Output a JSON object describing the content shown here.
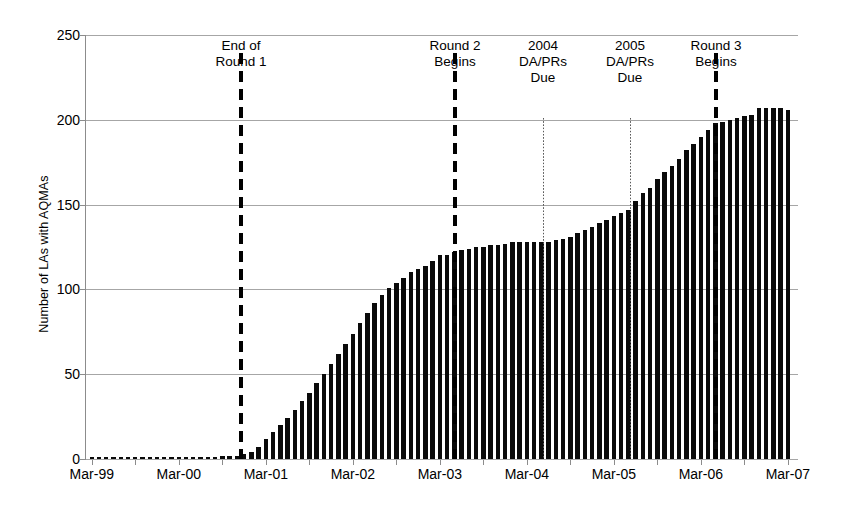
{
  "chart_data": {
    "type": "bar",
    "title": "",
    "xlabel": "",
    "ylabel": "Number of LAs with AQMAs",
    "ylim": [
      0,
      250
    ],
    "yticks": [
      0,
      50,
      100,
      150,
      200,
      250
    ],
    "ytick_labels": [
      "0",
      "50",
      "100",
      "150",
      "200",
      "250"
    ],
    "xtick_labels": [
      "Mar-99",
      "Mar-00",
      "Mar-01",
      "Mar-02",
      "Mar-03",
      "Mar-04",
      "Mar-05",
      "Mar-06",
      "Mar-07"
    ],
    "grid": "horizontal",
    "legend": "none",
    "bar_color": "#0a0a0a",
    "gridline_color": "#a6a6a6",
    "x_start": "Mar-99",
    "x_interval": "monthly",
    "categories": [
      "Mar-99",
      "Apr-99",
      "May-99",
      "Jun-99",
      "Jul-99",
      "Aug-99",
      "Sep-99",
      "Oct-99",
      "Nov-99",
      "Dec-99",
      "Jan-00",
      "Feb-00",
      "Mar-00",
      "Apr-00",
      "May-00",
      "Jun-00",
      "Jul-00",
      "Aug-00",
      "Sep-00",
      "Oct-00",
      "Nov-00",
      "Dec-00",
      "Jan-01",
      "Feb-01",
      "Mar-01",
      "Apr-01",
      "May-01",
      "Jun-01",
      "Jul-01",
      "Aug-01",
      "Sep-01",
      "Oct-01",
      "Nov-01",
      "Dec-01",
      "Jan-02",
      "Feb-02",
      "Mar-02",
      "Apr-02",
      "May-02",
      "Jun-02",
      "Jul-02",
      "Aug-02",
      "Sep-02",
      "Oct-02",
      "Nov-02",
      "Dec-02",
      "Jan-03",
      "Feb-03",
      "Mar-03",
      "Apr-03",
      "May-03",
      "Jun-03",
      "Jul-03",
      "Aug-03",
      "Sep-03",
      "Oct-03",
      "Nov-03",
      "Dec-03",
      "Jan-04",
      "Feb-04",
      "Mar-04",
      "Apr-04",
      "May-04",
      "Jun-04",
      "Jul-04",
      "Aug-04",
      "Sep-04",
      "Oct-04",
      "Nov-04",
      "Dec-04",
      "Jan-05",
      "Feb-05",
      "Mar-05",
      "Apr-05",
      "May-05",
      "Jun-05",
      "Jul-05",
      "Aug-05",
      "Sep-05",
      "Oct-05",
      "Nov-05",
      "Dec-05",
      "Jan-06",
      "Feb-06",
      "Mar-06",
      "Apr-06",
      "May-06",
      "Jun-06",
      "Jul-06",
      "Aug-06",
      "Sep-06",
      "Oct-06",
      "Nov-06",
      "Dec-06",
      "Jan-07",
      "Feb-07",
      "Mar-07"
    ],
    "values": [
      1,
      1,
      1,
      1,
      1,
      1,
      1,
      1,
      1,
      1,
      1,
      1,
      1,
      1,
      1,
      1,
      1,
      1,
      2,
      2,
      2,
      3,
      4,
      7,
      12,
      16,
      20,
      24,
      29,
      34,
      39,
      45,
      50,
      56,
      62,
      68,
      74,
      80,
      86,
      92,
      97,
      101,
      104,
      107,
      110,
      112,
      114,
      117,
      120,
      120,
      122,
      123,
      124,
      125,
      125,
      126,
      126,
      127,
      128,
      128,
      128,
      128,
      128,
      128,
      129,
      130,
      131,
      133,
      135,
      137,
      139,
      141,
      143,
      145,
      147,
      152,
      157,
      160,
      165,
      169,
      173,
      177,
      182,
      186,
      190,
      194,
      198,
      199,
      200,
      201,
      202,
      203,
      207,
      207,
      207,
      207,
      206
    ]
  },
  "annotations": [
    {
      "id": "end-of-round-1",
      "label": "End of\nRound 1",
      "x_category": "Dec-00",
      "line_style": "dashed",
      "line_top": 53,
      "line_bottom": 459,
      "label_top": 38,
      "x_px": 241
    },
    {
      "id": "round-2-begins",
      "label": "Round 2\nBegins",
      "x_category": "Mar-03",
      "line_style": "dashed",
      "line_top": 53,
      "line_bottom": 459,
      "label_top": 38,
      "x_px": 455
    },
    {
      "id": "2004-dapr-due",
      "label": "2004\nDA/PRs\nDue",
      "x_category": "Apr-04",
      "line_style": "dotted",
      "line_top": 118,
      "line_bottom": 459,
      "label_top": 38,
      "x_px": 543
    },
    {
      "id": "2005-dapr-due",
      "label": "2005\nDA/PRs\nDue",
      "x_category": "Apr-05",
      "line_style": "dotted",
      "line_top": 118,
      "line_bottom": 459,
      "label_top": 38,
      "x_px": 630
    },
    {
      "id": "round-3-begins",
      "label": "Round 3\nBegins",
      "x_category": "Apr-06",
      "line_style": "dashed",
      "line_top": 53,
      "line_bottom": 459,
      "label_top": 38,
      "x_px": 716
    }
  ]
}
